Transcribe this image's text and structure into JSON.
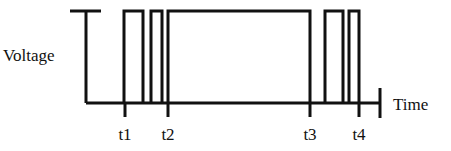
{
  "diagram": {
    "type": "pulse-waveform",
    "y_axis_label": "Voltage",
    "x_axis_label": "Time",
    "line_color": "#111111",
    "background": "#ffffff",
    "time_markers": [
      {
        "label": "t1",
        "x": 125
      },
      {
        "label": "t2",
        "x": 168
      },
      {
        "label": "t3",
        "x": 310
      },
      {
        "label": "t4",
        "x": 359
      }
    ],
    "pulses": [
      {
        "rise": 124,
        "fall": 143
      },
      {
        "rise": 151,
        "fall": 162
      },
      {
        "rise": 168,
        "fall": 310
      },
      {
        "rise": 325,
        "fall": 343
      },
      {
        "rise": 349,
        "fall": 359
      }
    ],
    "levels": {
      "high_y": 11,
      "low_y": 103
    }
  }
}
